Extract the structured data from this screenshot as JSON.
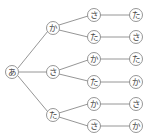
{
  "diagram": {
    "type": "tree",
    "root": {
      "label": "あ",
      "children": [
        {
          "label": "か",
          "children": [
            {
              "label": "さ",
              "children": [
                {
                  "label": "た"
                }
              ]
            },
            {
              "label": "た",
              "children": [
                {
                  "label": "さ"
                }
              ]
            }
          ]
        },
        {
          "label": "さ",
          "children": [
            {
              "label": "か",
              "children": [
                {
                  "label": "た"
                }
              ]
            },
            {
              "label": "た",
              "children": [
                {
                  "label": "か"
                }
              ]
            }
          ]
        },
        {
          "label": "た",
          "children": [
            {
              "label": "か",
              "children": [
                {
                  "label": "さ"
                }
              ]
            },
            {
              "label": "さ",
              "children": [
                {
                  "label": "か"
                }
              ]
            }
          ]
        }
      ]
    },
    "colors": {
      "line": "#8a8a8a",
      "text": "#444444",
      "background": "#ffffff"
    }
  },
  "nodes": {
    "root": "あ",
    "l1": [
      "か",
      "さ",
      "た"
    ],
    "l2": [
      "さ",
      "た",
      "か",
      "た",
      "か",
      "さ"
    ],
    "l3": [
      "た",
      "さ",
      "た",
      "か",
      "さ",
      "か"
    ]
  }
}
